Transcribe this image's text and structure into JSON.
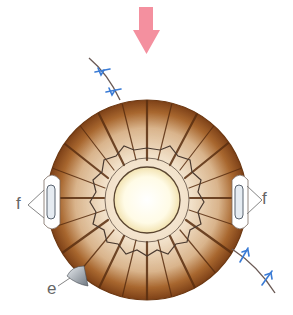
{
  "diagram": {
    "type": "anatomical-illustration",
    "labels": {
      "f_left": "f",
      "f_right": "f",
      "e": "e"
    },
    "colors": {
      "arrow": "#f4909f",
      "iris_outer": "#8a4a1c",
      "iris_inner": "#f3e4d0",
      "pupil": "#fffbe6",
      "suture_line": "#6b5a55",
      "suture_stitch": "#3a7bd5",
      "capsule": "#dfe6ee",
      "label_text": "#666666"
    },
    "elements": [
      {
        "name": "direction-arrow",
        "description": "pink downward arrow above the eye"
      },
      {
        "name": "iris",
        "description": "brown radially-striated iris disc"
      },
      {
        "name": "pupil",
        "description": "pale yellow central pupil"
      },
      {
        "name": "collarette",
        "description": "wavy ring around pupil"
      },
      {
        "name": "suture-upper-left",
        "description": "curved line with two blue stitches"
      },
      {
        "name": "suture-lower-right",
        "description": "curved line with two blue stitches"
      },
      {
        "name": "capsule-left",
        "description": "white capsule structure labeled f"
      },
      {
        "name": "capsule-right",
        "description": "white capsule structure labeled f"
      },
      {
        "name": "wedge-e",
        "description": "gray wedge at lower-left labeled e"
      }
    ]
  }
}
